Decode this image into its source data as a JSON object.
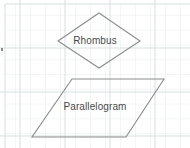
{
  "figure": {
    "background": {
      "paper_color": "#ffffff",
      "grid_minor_color": "#e8eced",
      "grid_major_color": "#d7dddf",
      "grid_spacing_px": 15,
      "grid_visible": true
    },
    "stroke_color": "#8c8c8c",
    "stroke_width": 1,
    "label_color": "#4a4a4a",
    "fill": "none"
  },
  "shapes": [
    {
      "id": "rhombus",
      "name": "rhombus",
      "label": "Rhombus",
      "label_x": 99,
      "label_y": 41,
      "points": "99,13 140,41 99,68 58,41",
      "vertices": [
        {
          "x": 99,
          "y": 13
        },
        {
          "x": 140,
          "y": 41
        },
        {
          "x": 99,
          "y": 68
        },
        {
          "x": 58,
          "y": 41
        }
      ]
    },
    {
      "id": "parallelogram",
      "name": "parallelogram",
      "label": "Parallelogram",
      "label_x": 98,
      "label_y": 107,
      "points": "72,79 164,79 126,137 32,137",
      "vertices": [
        {
          "x": 72,
          "y": 79
        },
        {
          "x": 164,
          "y": 79
        },
        {
          "x": 126,
          "y": 137
        },
        {
          "x": 32,
          "y": 137
        }
      ]
    }
  ],
  "artifacts": {
    "left_edge_mark": "•"
  }
}
